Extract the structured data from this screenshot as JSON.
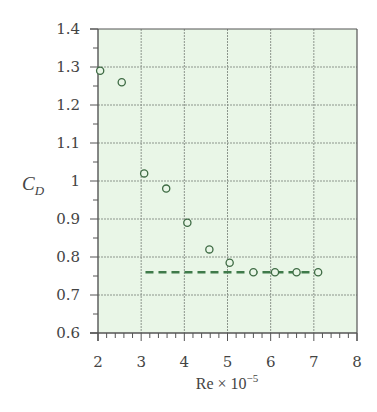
{
  "chart_data": {
    "type": "scatter",
    "title": "",
    "xlabel": "Re × 10",
    "xlabel_exponent": "−5",
    "ylabel": "C",
    "ylabel_subscript": "D",
    "xlim": [
      2,
      8
    ],
    "ylim": [
      0.6,
      1.4
    ],
    "x_ticks": [
      2,
      3,
      4,
      5,
      6,
      7,
      8
    ],
    "x_tick_labels": [
      "2",
      "3",
      "4",
      "5",
      "6",
      "7",
      "8"
    ],
    "y_ticks": [
      0.6,
      0.7,
      0.8,
      0.9,
      1.0,
      1.1,
      1.2,
      1.3,
      1.4
    ],
    "y_tick_labels": [
      "0.6",
      "0.7",
      "0.8",
      "0.9",
      "1",
      "1.1",
      "1.2",
      "1.3",
      "1.4"
    ],
    "grid": true,
    "legend": null,
    "series": [
      {
        "name": "measured",
        "marker": "open-circle",
        "x": [
          2.05,
          2.55,
          3.07,
          3.58,
          4.07,
          4.58,
          5.05,
          5.6,
          6.1,
          6.6,
          7.1
        ],
        "y": [
          1.29,
          1.26,
          1.02,
          0.98,
          0.89,
          0.82,
          0.785,
          0.76,
          0.76,
          0.76,
          0.76
        ]
      },
      {
        "name": "asymptote",
        "style": "dashed",
        "x": [
          3.1,
          7.15
        ],
        "y": [
          0.76,
          0.76
        ]
      }
    ]
  },
  "colors": {
    "plot_background": "#e9f6e7",
    "grid": "#8c958c",
    "axis": "#555555",
    "marker_stroke": "#3e6b44",
    "dashed_line": "#3f7a4a"
  }
}
